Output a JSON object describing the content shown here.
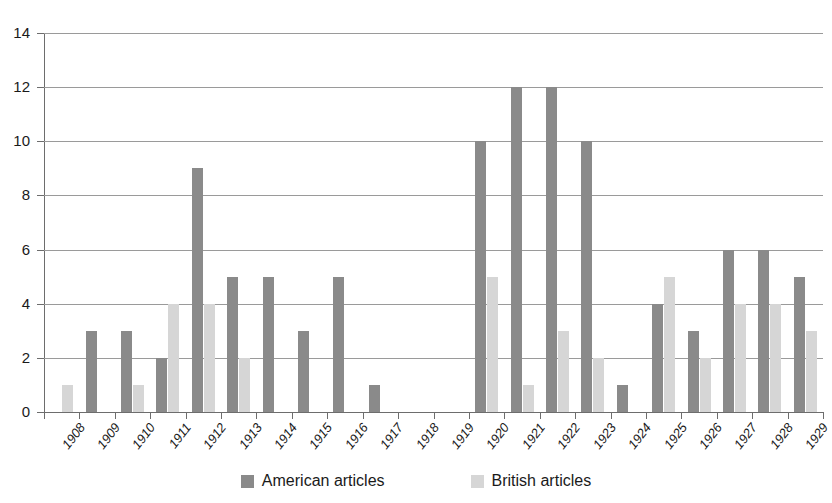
{
  "chart_data": {
    "type": "bar",
    "title": "",
    "subtitle": "",
    "xlabel": "",
    "ylabel": "",
    "ylim": [
      0,
      14
    ],
    "ytick_step": 2,
    "yticks": [
      "0",
      "2",
      "4",
      "6",
      "8",
      "10",
      "12",
      "14"
    ],
    "grid": true,
    "grid_axis": "y",
    "legend_position": "bottom-center",
    "categories": [
      "1908",
      "1909",
      "1910",
      "1911",
      "1912",
      "1913",
      "1914",
      "1915",
      "1916",
      "1917",
      "1918",
      "1919",
      "1920",
      "1921",
      "1922",
      "1923",
      "1924",
      "1925",
      "1926",
      "1927",
      "1928",
      "1929"
    ],
    "series": [
      {
        "name": "American articles",
        "color": "#8a8a8a",
        "values": [
          0,
          3,
          3,
          2,
          9,
          5,
          5,
          3,
          5,
          1,
          0,
          0,
          10,
          12,
          12,
          10,
          1,
          4,
          3,
          6,
          6,
          5
        ]
      },
      {
        "name": "British articles",
        "color": "#d6d6d6",
        "values": [
          1,
          0,
          1,
          4,
          4,
          2,
          0,
          0,
          0,
          0,
          0,
          0,
          5,
          1,
          3,
          2,
          0,
          5,
          2,
          4,
          4,
          3
        ]
      }
    ]
  },
  "legend": {
    "items": [
      {
        "label": "American articles",
        "swatch": "american"
      },
      {
        "label": "British articles",
        "swatch": "british"
      }
    ]
  }
}
